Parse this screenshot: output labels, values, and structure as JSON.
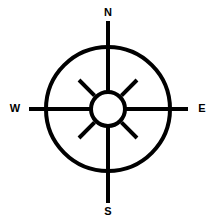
{
  "figure": {
    "name": "compass-rose",
    "background_color": "#ffffff",
    "stroke_color": "#000000",
    "width": 217,
    "height": 224
  },
  "geometry": {
    "center_x": 108,
    "center_y": 109,
    "outer_circle_radius": 62,
    "hub_circle_radius": 17,
    "stroke_width": 4,
    "hub_stroke_width": 4,
    "diagonal_inner_radius": 19,
    "diagonal_outer_radius": 41,
    "arm_north_tip_y": 21,
    "arm_south_tip_y": 203,
    "arm_west_tip_x": 29,
    "arm_east_tip_x": 188
  },
  "labels": {
    "north": {
      "text": "N",
      "x": 108,
      "y": 13
    },
    "south": {
      "text": "S",
      "x": 108,
      "y": 212
    },
    "west": {
      "text": "W",
      "x": 15,
      "y": 109
    },
    "east": {
      "text": "E",
      "x": 202,
      "y": 109
    }
  },
  "spokes": {
    "cardinal_count": 4,
    "diagonal_count": 4,
    "diagonal_angles_deg": [
      45,
      135,
      225,
      315
    ]
  }
}
